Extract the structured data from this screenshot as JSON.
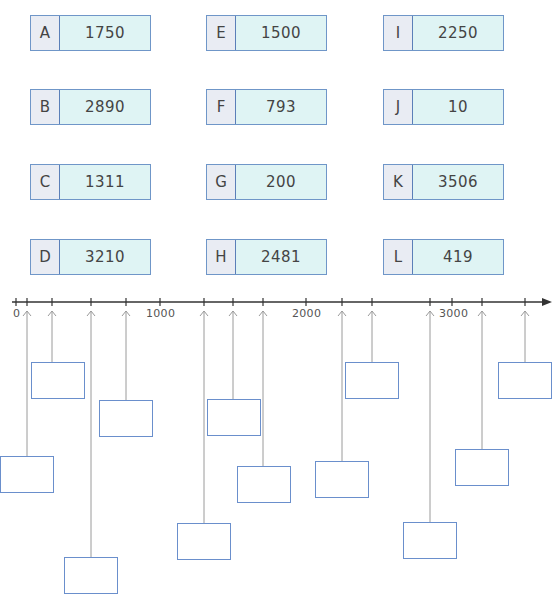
{
  "cards": [
    {
      "letter": "A",
      "value": "1750",
      "x": 30,
      "y": 15
    },
    {
      "letter": "B",
      "value": "2890",
      "x": 30,
      "y": 89
    },
    {
      "letter": "C",
      "value": "1311",
      "x": 30,
      "y": 164
    },
    {
      "letter": "D",
      "value": "3210",
      "x": 30,
      "y": 239
    },
    {
      "letter": "E",
      "value": "1500",
      "x": 206,
      "y": 15
    },
    {
      "letter": "F",
      "value": "793",
      "x": 206,
      "y": 89
    },
    {
      "letter": "G",
      "value": "200",
      "x": 206,
      "y": 164
    },
    {
      "letter": "H",
      "value": "2481",
      "x": 206,
      "y": 239
    },
    {
      "letter": "I",
      "value": "2250",
      "x": 383,
      "y": 15
    },
    {
      "letter": "J",
      "value": "10",
      "x": 383,
      "y": 89
    },
    {
      "letter": "K",
      "value": "3506",
      "x": 383,
      "y": 164
    },
    {
      "letter": "L",
      "value": "419",
      "x": 383,
      "y": 239
    }
  ],
  "number_line": {
    "tick_labels": [
      {
        "label": "0",
        "x": 13
      },
      {
        "label": "1000",
        "x": 146
      },
      {
        "label": "2000",
        "x": 292
      },
      {
        "label": "3000",
        "x": 439
      }
    ],
    "axis_y": 302,
    "axis_start_x": 12,
    "axis_end_x": 552
  },
  "answer_boxes": [
    {
      "line_x": 27,
      "x": 0,
      "y": 456
    },
    {
      "line_x": 52,
      "x": 31,
      "y": 362
    },
    {
      "line_x": 91,
      "x": 64,
      "y": 557
    },
    {
      "line_x": 126,
      "x": 99,
      "y": 400
    },
    {
      "line_x": 204,
      "x": 177,
      "y": 523
    },
    {
      "line_x": 233,
      "x": 207,
      "y": 399
    },
    {
      "line_x": 263,
      "x": 237,
      "y": 466
    },
    {
      "line_x": 342,
      "x": 315,
      "y": 461
    },
    {
      "line_x": 372,
      "x": 345,
      "y": 362
    },
    {
      "line_x": 430,
      "x": 403,
      "y": 522
    },
    {
      "line_x": 482,
      "x": 455,
      "y": 449
    },
    {
      "line_x": 525,
      "x": 498,
      "y": 362
    }
  ],
  "colors": {
    "card_value_bg": "#dff4f4",
    "card_letter_bg": "#e9ecf3",
    "card_border": "#6f96c8",
    "answer_box_border": "#6a8fcc",
    "leader_line": "#9a9a9a",
    "axis": "#333333"
  }
}
